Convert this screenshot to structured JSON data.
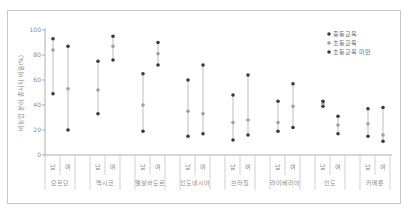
{
  "chart_data": {
    "type": "dot-range",
    "title": "",
    "ylabel": "비농업 분야 종사자 비율(%)",
    "xlabel": "",
    "ylim": [
      0,
      100
    ],
    "yticks": [
      0,
      20,
      40,
      60,
      80,
      100
    ],
    "grid": false,
    "legend_position": "upper-right",
    "legend": [
      {
        "name": "중등교육",
        "color": "#3a3a3a"
      },
      {
        "name": "초등교육",
        "color": "#a0a0a0"
      },
      {
        "name": "초등교육 미만",
        "color": "#3a3a3a"
      }
    ],
    "sex_labels": [
      "남",
      "여"
    ],
    "categories": [
      "요르단",
      "멕시코",
      "엘살바도르",
      "인도네시아",
      "브라질",
      "라이베리아",
      "인도",
      "카메룬"
    ],
    "series": [
      {
        "name": "중등교육",
        "values": [
          [
            93,
            87
          ],
          [
            75,
            95
          ],
          [
            65,
            90
          ],
          [
            60,
            72
          ],
          [
            48,
            64
          ],
          [
            43,
            57
          ],
          [
            43,
            31
          ],
          [
            37,
            38
          ]
        ]
      },
      {
        "name": "초등교육",
        "values": [
          [
            84,
            53
          ],
          [
            52,
            87
          ],
          [
            40,
            81
          ],
          [
            35,
            33
          ],
          [
            26,
            28
          ],
          [
            26,
            39
          ],
          [
            41,
            24
          ],
          [
            25,
            16
          ]
        ]
      },
      {
        "name": "초등교육 미만",
        "values": [
          [
            49,
            20
          ],
          [
            33,
            76
          ],
          [
            19,
            72
          ],
          [
            15,
            17
          ],
          [
            12,
            16
          ],
          [
            19,
            22
          ],
          [
            39,
            17
          ],
          [
            15,
            11
          ]
        ]
      }
    ]
  },
  "colors": {
    "dark_dot": "#3a3a3a",
    "light_dot": "#a0a0a0",
    "line": "#b5b5b5",
    "axis": "#9a9a9a"
  }
}
